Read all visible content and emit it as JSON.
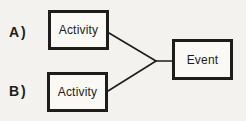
{
  "colors": {
    "background": "#f3f2ef",
    "ink": "#1d1d1b",
    "box_fill": "#faf9f6"
  },
  "diagram": {
    "label_a": "A)",
    "label_b": "B)",
    "activity_a": "Activity",
    "activity_b": "Activity",
    "event": "Event"
  }
}
